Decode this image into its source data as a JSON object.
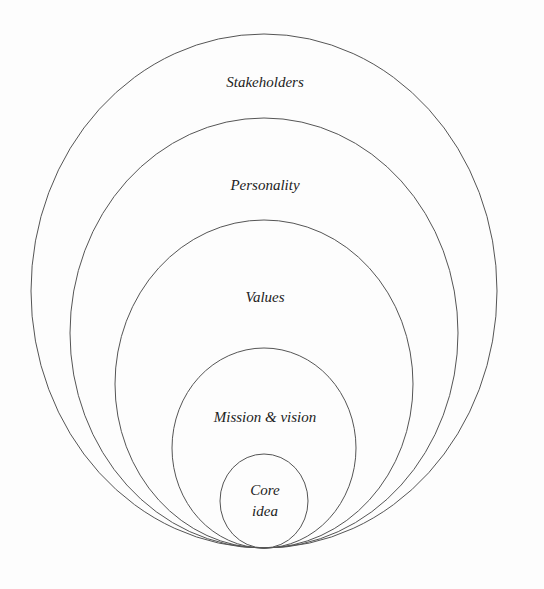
{
  "diagram": {
    "type": "nested-circles",
    "stroke_color": "#555555",
    "layers": [
      {
        "label": "Stakeholders",
        "cx": 264,
        "cy": 291,
        "rx": 233,
        "ry": 257,
        "label_x": 265,
        "label_y": 82
      },
      {
        "label": "Personality",
        "cx": 264,
        "cy": 333,
        "rx": 194,
        "ry": 215,
        "label_x": 265,
        "label_y": 185
      },
      {
        "label": "Values",
        "cx": 264,
        "cy": 384,
        "rx": 149,
        "ry": 164,
        "label_x": 265,
        "label_y": 297
      },
      {
        "label": "Mission & vision",
        "cx": 264,
        "cy": 448,
        "rx": 92,
        "ry": 100,
        "label_x": 265,
        "label_y": 417
      },
      {
        "label": "Core",
        "label2": "idea",
        "cx": 264,
        "cy": 501,
        "rx": 44,
        "ry": 47,
        "label_x": 265,
        "label_y": 500
      }
    ]
  }
}
